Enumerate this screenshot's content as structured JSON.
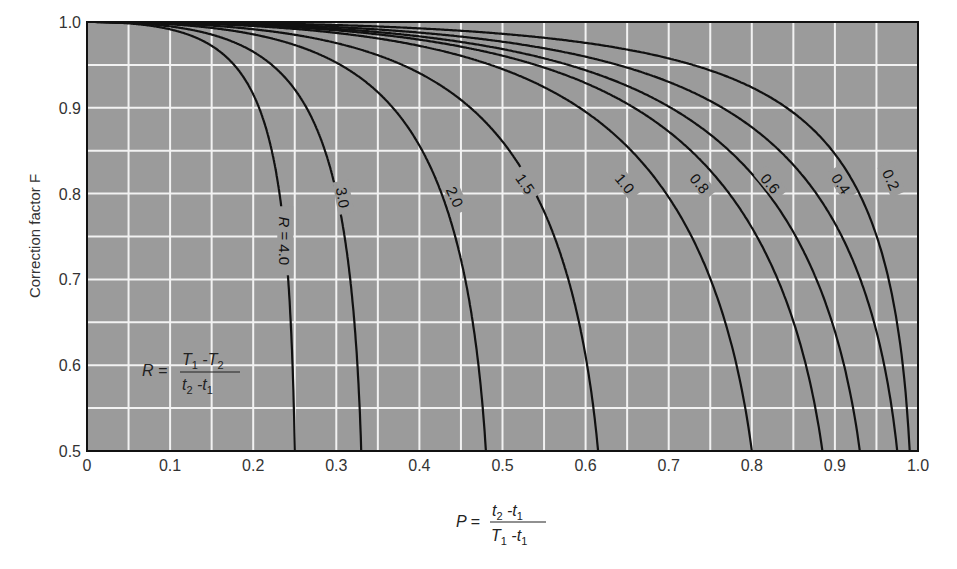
{
  "chart_data": {
    "type": "line",
    "title": "",
    "xlabel": "P = (t2 - t1) / (T1 - t1)",
    "ylabel": "Correction factor F",
    "xlim": [
      0,
      1.0
    ],
    "ylim": [
      0.5,
      1.0
    ],
    "grid": true,
    "grid_step_x": 0.05,
    "grid_step_y": 0.05,
    "x_ticks": [
      "0",
      "0.1",
      "0.2",
      "0.3",
      "0.4",
      "0.5",
      "0.6",
      "0.7",
      "0.8",
      "0.9",
      "1.0"
    ],
    "y_ticks": [
      "0.5",
      "0.6",
      "0.7",
      "0.8",
      "0.9",
      "1.0"
    ],
    "parameter": "R = (T1 - T2) / (t2 - t1)",
    "series": [
      {
        "name": "R = 4.0",
        "label": "R = 4.0",
        "R": 4.0,
        "p_at_F05": 0.25,
        "label_pos": [
          0.235,
          0.745
        ],
        "label_rot": 90
      },
      {
        "name": "3.0",
        "label": "3.0",
        "R": 3.0,
        "p_at_F05": 0.33,
        "label_pos": [
          0.305,
          0.795
        ],
        "label_rot": 80
      },
      {
        "name": "2.0",
        "label": "2.0",
        "R": 2.0,
        "p_at_F05": 0.48,
        "label_pos": [
          0.44,
          0.795
        ],
        "label_rot": 65
      },
      {
        "name": "1.5",
        "label": "1.5",
        "R": 1.5,
        "p_at_F05": 0.615,
        "label_pos": [
          0.525,
          0.81
        ],
        "label_rot": 55
      },
      {
        "name": "1.0",
        "label": "1.0",
        "R": 1.0,
        "p_at_F05": 0.8,
        "label_pos": [
          0.645,
          0.81
        ],
        "label_rot": 50
      },
      {
        "name": "0.8",
        "label": "0.8",
        "R": 0.8,
        "p_at_F05": 0.885,
        "label_pos": [
          0.735,
          0.81
        ],
        "label_rot": 50
      },
      {
        "name": "0.6",
        "label": "0.6",
        "R": 0.6,
        "p_at_F05": 0.93,
        "label_pos": [
          0.82,
          0.81
        ],
        "label_rot": 50
      },
      {
        "name": "0.4",
        "label": "0.4",
        "R": 0.4,
        "p_at_F05": 0.975,
        "label_pos": [
          0.905,
          0.81
        ],
        "label_rot": 55
      },
      {
        "name": "0.2",
        "label": "0.2",
        "R": 0.2,
        "p_at_F05": 0.99,
        "label_pos": [
          0.965,
          0.815
        ],
        "label_rot": 65
      }
    ]
  },
  "labels": {
    "y_axis_title": "Correction factor F",
    "p_prefix": "P =",
    "p_numerator_a": "t",
    "p_numerator_a_sub": "2",
    "p_numerator_b": " -t",
    "p_numerator_b_sub": "1",
    "p_denominator_a": "T",
    "p_denominator_a_sub": "1",
    "p_denominator_b": " -t",
    "p_denominator_b_sub": "1",
    "r_prefix": "R =",
    "r_numerator_a": "T",
    "r_numerator_a_sub": "1",
    "r_numerator_b": " -T",
    "r_numerator_b_sub": "2",
    "r_denominator_a": "t",
    "r_denominator_a_sub": "2",
    "r_denominator_b": " -t",
    "r_denominator_b_sub": "1"
  },
  "colors": {
    "plot_bg": "#9b9b9b",
    "grid": "#f2f2f2",
    "curve": "#111111",
    "frame": "#111111"
  }
}
